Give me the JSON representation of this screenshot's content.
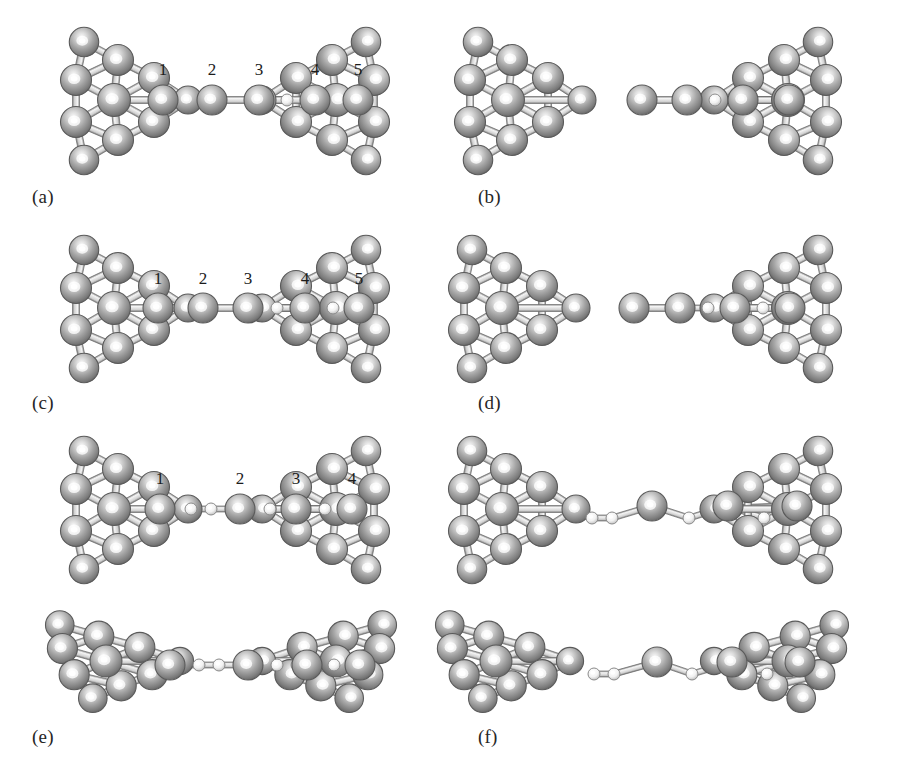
{
  "figure": {
    "kind": "molecular-structure-figure",
    "width": 904,
    "height": 763,
    "background": "#ffffff",
    "colors": {
      "metal_atom": "#9a9a9a",
      "metal_atom_dark": "#6b6b6b",
      "metal_highlight": "#f2f2f2",
      "light_atom": "#f0f0f0",
      "light_atom_edge": "#7d7d7d",
      "bond": "#d8d8d8",
      "bond_edge": "#6f6f6f",
      "label_text": "#262626"
    }
  },
  "panels": [
    {
      "id": "a",
      "label": "(a)",
      "label_x": 32,
      "label_y": 186,
      "origin_x": 0,
      "origin_y": 18,
      "chain_y": 82,
      "left_electrode": {
        "present": true,
        "x": 78,
        "style": "pyramid",
        "detached": false
      },
      "right_electrode": {
        "present": true,
        "x": 372,
        "style": "pyramid-mirror"
      },
      "numbers": [
        "1",
        "2",
        "3",
        "4",
        "5"
      ],
      "number_y": 57,
      "chain_atoms": [
        {
          "x": 163,
          "r": 15,
          "type": "metal",
          "number": "1"
        },
        {
          "x": 212,
          "r": 15,
          "type": "metal",
          "number": "2"
        },
        {
          "x": 259,
          "r": 15,
          "type": "metal",
          "number": "3"
        },
        {
          "x": 287,
          "r": 6,
          "type": "light",
          "number": ""
        },
        {
          "x": 315,
          "r": 15,
          "type": "metal",
          "number": "4"
        },
        {
          "x": 358,
          "r": 15,
          "type": "metal",
          "number": "5"
        }
      ]
    },
    {
      "id": "b",
      "label": "(b)",
      "label_x": 478,
      "label_y": 186,
      "origin_x": 452,
      "origin_y": 18,
      "chain_y": 82,
      "left_electrode": {
        "present": true,
        "x": 20,
        "style": "pyramid",
        "detached": true
      },
      "right_electrode": {
        "present": true,
        "x": 372,
        "style": "pyramid-mirror"
      },
      "numbers": [],
      "number_y": 57,
      "chain_atoms": [
        {
          "x": 190,
          "r": 15,
          "type": "metal",
          "number": ""
        },
        {
          "x": 235,
          "r": 15,
          "type": "metal",
          "number": ""
        },
        {
          "x": 263,
          "r": 6,
          "type": "light",
          "number": ""
        },
        {
          "x": 291,
          "r": 15,
          "type": "metal",
          "number": ""
        },
        {
          "x": 337,
          "r": 15,
          "type": "metal",
          "number": ""
        }
      ]
    },
    {
      "id": "c",
      "label": "(c)",
      "label_x": 32,
      "label_y": 392,
      "origin_x": 0,
      "origin_y": 222,
      "chain_y": 86,
      "left_electrode": {
        "present": true,
        "x": 78,
        "style": "pyramid",
        "detached": false
      },
      "right_electrode": {
        "present": true,
        "x": 372,
        "style": "pyramid-mirror"
      },
      "numbers": [
        "1",
        "2",
        "3",
        "4",
        "5"
      ],
      "number_y": 62,
      "chain_atoms": [
        {
          "x": 158,
          "r": 15,
          "type": "metal",
          "number": "1"
        },
        {
          "x": 203,
          "r": 15,
          "type": "metal",
          "number": "2"
        },
        {
          "x": 248,
          "r": 15,
          "type": "metal",
          "number": "3"
        },
        {
          "x": 277,
          "r": 6,
          "type": "light",
          "number": ""
        },
        {
          "x": 305,
          "r": 15,
          "type": "metal",
          "number": "4"
        },
        {
          "x": 333,
          "r": 6,
          "type": "light",
          "number": ""
        },
        {
          "x": 359,
          "r": 15,
          "type": "metal",
          "number": "5"
        }
      ]
    },
    {
      "id": "d",
      "label": "(d)",
      "label_x": 478,
      "label_y": 392,
      "origin_x": 452,
      "origin_y": 222,
      "chain_y": 86,
      "left_electrode": {
        "present": true,
        "x": 14,
        "style": "pyramid",
        "detached": true
      },
      "right_electrode": {
        "present": true,
        "x": 372,
        "style": "pyramid-mirror"
      },
      "numbers": [],
      "number_y": 62,
      "chain_atoms": [
        {
          "x": 182,
          "r": 15,
          "type": "metal",
          "number": ""
        },
        {
          "x": 228,
          "r": 15,
          "type": "metal",
          "number": ""
        },
        {
          "x": 256,
          "r": 6,
          "type": "light",
          "number": ""
        },
        {
          "x": 283,
          "r": 15,
          "type": "metal",
          "number": ""
        },
        {
          "x": 311,
          "r": 6,
          "type": "light",
          "number": ""
        },
        {
          "x": 338,
          "r": 15,
          "type": "metal",
          "number": ""
        }
      ]
    },
    {
      "id": "e-top",
      "label": "",
      "label_x": 0,
      "label_y": 0,
      "origin_x": 0,
      "origin_y": 425,
      "chain_y": 84,
      "left_electrode": {
        "present": true,
        "x": 78,
        "style": "pyramid",
        "detached": false
      },
      "right_electrode": {
        "present": true,
        "x": 372,
        "style": "pyramid-mirror"
      },
      "numbers": [
        "1",
        "2",
        "3",
        "4"
      ],
      "number_y": 59,
      "chain_atoms": [
        {
          "x": 160,
          "r": 15,
          "type": "metal",
          "number": "1"
        },
        {
          "x": 191,
          "r": 6,
          "type": "light",
          "number": ""
        },
        {
          "x": 211,
          "r": 6,
          "type": "light",
          "number": ""
        },
        {
          "x": 240,
          "r": 15,
          "type": "metal",
          "number": "2"
        },
        {
          "x": 270,
          "r": 6,
          "type": "light",
          "number": ""
        },
        {
          "x": 290,
          "r": 6,
          "type": "light",
          "number": ""
        },
        {
          "x": 296,
          "r": 15,
          "type": "metal",
          "number": "3"
        },
        {
          "x": 325,
          "r": 6,
          "type": "light",
          "number": ""
        },
        {
          "x": 352,
          "r": 15,
          "type": "metal",
          "number": "4"
        }
      ]
    },
    {
      "id": "f-top",
      "label": "",
      "label_x": 0,
      "label_y": 0,
      "origin_x": 452,
      "origin_y": 425,
      "chain_y": 84,
      "left_electrode": {
        "present": true,
        "x": 14,
        "style": "pyramid",
        "detached": true
      },
      "right_electrode": {
        "present": true,
        "x": 372,
        "style": "pyramid-mirror"
      },
      "numbers": [],
      "number_y": 59,
      "chain_atoms": [
        {
          "x": 140,
          "r": 6,
          "type": "light",
          "number": ""
        },
        {
          "x": 160,
          "r": 6,
          "type": "light",
          "number": ""
        },
        {
          "x": 200,
          "r": 15,
          "type": "metal",
          "number": ""
        },
        {
          "x": 237,
          "r": 6,
          "type": "light",
          "number": ""
        },
        {
          "x": 276,
          "r": 15,
          "type": "metal",
          "number": ""
        },
        {
          "x": 312,
          "r": 6,
          "type": "light",
          "number": ""
        },
        {
          "x": 345,
          "r": 15,
          "type": "metal",
          "number": ""
        }
      ]
    },
    {
      "id": "e",
      "label": "(e)",
      "label_x": 32,
      "label_y": 726,
      "origin_x": 0,
      "origin_y": 600,
      "chain_y": 65,
      "left_electrode": {
        "present": true,
        "x": 70,
        "style": "tilted",
        "detached": false
      },
      "right_electrode": {
        "present": true,
        "x": 372,
        "style": "tilted-mirror"
      },
      "numbers": [],
      "number_y": 0,
      "chain_atoms": [
        {
          "x": 170,
          "r": 15,
          "type": "metal",
          "number": ""
        },
        {
          "x": 199,
          "r": 6,
          "type": "light",
          "number": ""
        },
        {
          "x": 219,
          "r": 6,
          "type": "light",
          "number": ""
        },
        {
          "x": 248,
          "r": 15,
          "type": "metal",
          "number": ""
        },
        {
          "x": 277,
          "r": 6,
          "type": "light",
          "number": ""
        },
        {
          "x": 297,
          "r": 6,
          "type": "light",
          "number": ""
        },
        {
          "x": 307,
          "r": 15,
          "type": "metal",
          "number": ""
        },
        {
          "x": 334,
          "r": 6,
          "type": "light",
          "number": ""
        },
        {
          "x": 360,
          "r": 15,
          "type": "metal",
          "number": ""
        }
      ]
    },
    {
      "id": "f",
      "label": "(f)",
      "label_x": 478,
      "label_y": 726,
      "origin_x": 452,
      "origin_y": 600,
      "chain_y": 65,
      "left_electrode": {
        "present": true,
        "x": 8,
        "style": "tilted",
        "detached": true
      },
      "right_electrode": {
        "present": true,
        "x": 372,
        "style": "tilted-mirror"
      },
      "numbers": [],
      "number_y": 0,
      "chain_atoms": [
        {
          "x": 142,
          "r": 6,
          "type": "light",
          "number": ""
        },
        {
          "x": 162,
          "r": 6,
          "type": "light",
          "number": ""
        },
        {
          "x": 205,
          "r": 15,
          "type": "metal",
          "number": ""
        },
        {
          "x": 240,
          "r": 6,
          "type": "light",
          "number": ""
        },
        {
          "x": 280,
          "r": 15,
          "type": "metal",
          "number": ""
        },
        {
          "x": 315,
          "r": 6,
          "type": "light",
          "number": ""
        },
        {
          "x": 348,
          "r": 15,
          "type": "metal",
          "number": ""
        }
      ]
    }
  ]
}
